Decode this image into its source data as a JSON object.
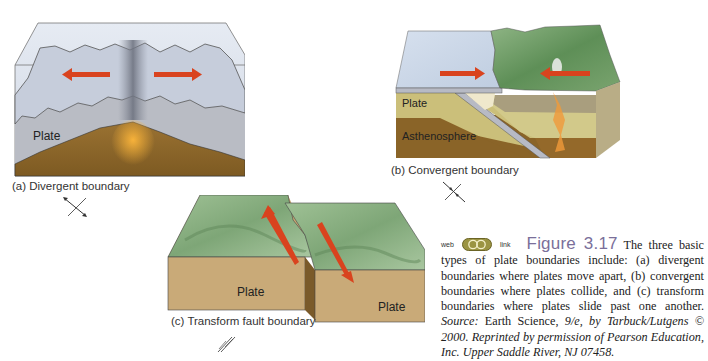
{
  "figure": {
    "number": "Figure 3.17",
    "web_label": "web",
    "link_label": "link",
    "caption_text": " The three basic types of plate boundaries include: (a) divergent boundaries where plates move apart, (b) convergent boundaries where plates collide, and (c) transform boundaries where plates slide past one another. ",
    "source_label": "Source:",
    "source_text": " Earth Science, ",
    "source_italic": "9/e, by Tarbuck/Lutgens © 2000. Reprinted by permission of Pearson Education, Inc. Upper Saddle River, NJ 07458.",
    "colors": {
      "figure_number": "#7a6f9a",
      "arrow": "#d9431e",
      "plate_gray": "#b9bcc6",
      "mantle_brown": "#8a6428",
      "land_green": "#6f9a66",
      "ocean_blue": "#c9d6e6"
    }
  },
  "panels": {
    "a": {
      "caption": "(a) Divergent boundary",
      "plate_label": "Plate",
      "symbol": "divergent-symbol"
    },
    "b": {
      "caption": "(b) Convergent boundary",
      "plate_label": "Plate",
      "asthenosphere_label": "Asthenosphere",
      "symbol": "convergent-symbol"
    },
    "c": {
      "caption": "(c) Transform fault boundary",
      "plate_label_left": "Plate",
      "plate_label_right": "Plate",
      "symbol": "transform-symbol"
    }
  }
}
